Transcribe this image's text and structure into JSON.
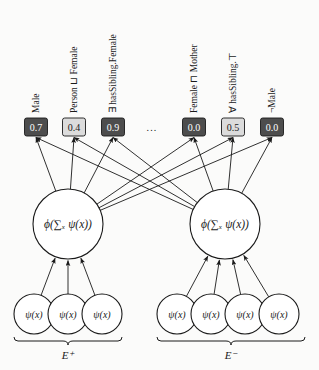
{
  "figure": {
    "type": "neural-network-diagram",
    "background_color": "#fbfbfa",
    "stroke_color": "#1a1a1a",
    "box_dark_fill": "#4d4d4d",
    "box_dark_text": "#ffffff",
    "box_light_fill": "#dcdcdc",
    "box_light_text": "#1a1a1a",
    "circle_fill": "#ffffff"
  },
  "output_layer": {
    "ellipsis": "...",
    "boxes": [
      {
        "id": "out-0",
        "label": "Male",
        "value": "0.7",
        "style": "dark",
        "cx": 36
      },
      {
        "id": "out-1",
        "label": "Person ⊔ Female",
        "value": "0.4",
        "style": "light",
        "cx": 74
      },
      {
        "id": "out-2",
        "label": "∃ hasSibling.Female",
        "value": "0.9",
        "style": "dark",
        "cx": 113
      },
      {
        "id": "out-3",
        "label": "Female ⊓ Mother",
        "value": "0.0",
        "style": "dark",
        "cx": 194
      },
      {
        "id": "out-4",
        "label": "∀ hasSibling.⊤",
        "value": "0.5",
        "style": "light",
        "cx": 233
      },
      {
        "id": "out-5",
        "label": "¬Male",
        "value": "0.0",
        "style": "dark",
        "cx": 272
      }
    ]
  },
  "aggregation_layer": {
    "nodes": [
      {
        "id": "agg-left",
        "label": "ϕ(∑ₓ ψ(x))",
        "cx": 68,
        "cy": 224,
        "r": 35
      },
      {
        "id": "agg-right",
        "label": "ϕ(∑ₓ ψ(x))",
        "cx": 225,
        "cy": 224,
        "r": 35
      }
    ]
  },
  "input_layer": {
    "groups": [
      {
        "id": "group-positive",
        "group_label": "E⁺",
        "brace_x1": 14,
        "brace_x2": 122,
        "nodes": [
          {
            "id": "in-p-0",
            "label": "ψ(x)",
            "cx": 34,
            "cy": 314,
            "r": 20
          },
          {
            "id": "in-p-1",
            "label": "ψ(x)",
            "cx": 68,
            "cy": 314,
            "r": 20
          },
          {
            "id": "in-p-2",
            "label": "ψ(x)",
            "cx": 102,
            "cy": 314,
            "r": 20
          }
        ]
      },
      {
        "id": "group-negative",
        "group_label": "E⁻",
        "brace_x1": 157,
        "brace_x2": 305,
        "nodes": [
          {
            "id": "in-n-0",
            "label": "ψ(x)",
            "cx": 177,
            "cy": 314,
            "r": 20
          },
          {
            "id": "in-n-1",
            "label": "ψ(x)",
            "cx": 211,
            "cy": 314,
            "r": 20
          },
          {
            "id": "in-n-2",
            "label": "ψ(x)",
            "cx": 245,
            "cy": 314,
            "r": 20
          },
          {
            "id": "in-n-3",
            "label": "ψ(x)",
            "cx": 279,
            "cy": 314,
            "r": 20
          }
        ]
      }
    ]
  }
}
